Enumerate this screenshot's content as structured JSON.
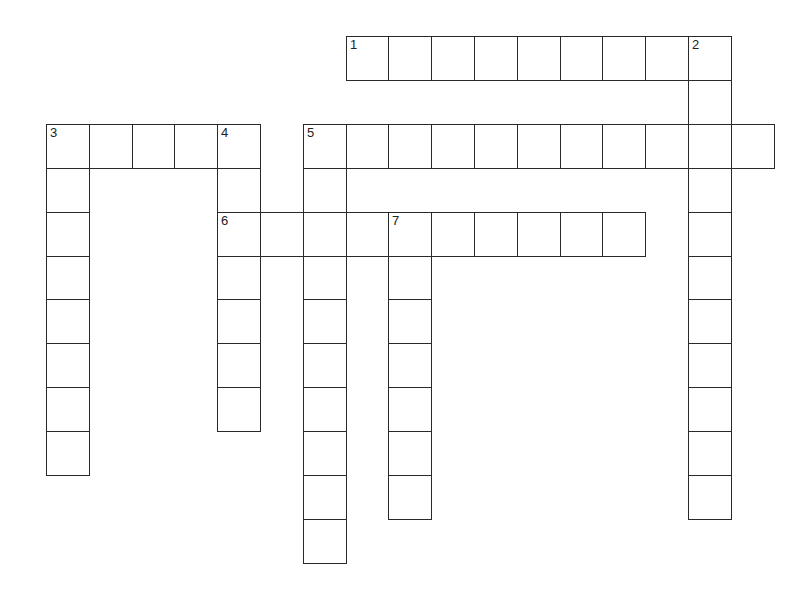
{
  "puzzle": {
    "type": "crossword",
    "origin": {
      "x": 46,
      "y": 36
    },
    "cell_w": 42.8,
    "cell_h": 43.9,
    "entries": [
      {
        "number": "1",
        "direction": "across",
        "row": 0,
        "col": 7,
        "length": 9
      },
      {
        "number": "2",
        "direction": "down",
        "row": 0,
        "col": 15,
        "length": 11
      },
      {
        "number": "3",
        "direction": "across",
        "row": 2,
        "col": 0,
        "length": 5
      },
      {
        "number": "3",
        "direction": "down",
        "row": 2,
        "col": 0,
        "length": 8
      },
      {
        "number": "4",
        "direction": "down",
        "row": 2,
        "col": 4,
        "length": 7
      },
      {
        "number": "5",
        "direction": "across",
        "row": 2,
        "col": 6,
        "length": 11
      },
      {
        "number": "5",
        "direction": "down",
        "row": 2,
        "col": 6,
        "length": 10
      },
      {
        "number": "6",
        "direction": "across",
        "row": 4,
        "col": 4,
        "length": 10
      },
      {
        "number": "7",
        "direction": "down",
        "row": 4,
        "col": 8,
        "length": 7
      }
    ]
  }
}
